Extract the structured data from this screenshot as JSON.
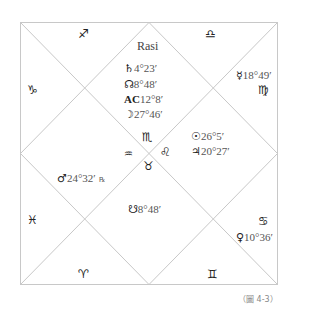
{
  "chart": {
    "title": "Rasi",
    "caption": "（圖 4-3）",
    "line_color": "#c8c8c8",
    "houses": {
      "top": {
        "sign": "♐"
      },
      "top_right": {
        "sign": "♎"
      },
      "right_upper": {
        "sign": "♍",
        "planets": [
          {
            "symbol": "☿",
            "degree": "18°49′"
          }
        ]
      },
      "right_lower": {
        "sign": "♋",
        "planets": [
          {
            "symbol": "♀",
            "degree": "10°36′"
          }
        ]
      },
      "bottom_right": {
        "sign": "♊"
      },
      "bottom_left": {
        "sign": "♈"
      },
      "left_lower": {
        "sign": "♓"
      },
      "left_upper": {
        "sign": "♑"
      },
      "center_top": {
        "sign": "♏",
        "planets": [
          {
            "symbol": "♄",
            "degree": "4°23′"
          },
          {
            "symbol": "☊",
            "degree": "8°48′"
          },
          {
            "symbol": "AC",
            "degree": "12°8′"
          },
          {
            "symbol": "☽",
            "degree": "27°46′"
          }
        ]
      },
      "center_right": {
        "sign": "♌",
        "planets": [
          {
            "symbol": "☉",
            "degree": "26°5′"
          },
          {
            "symbol": "♃",
            "degree": "20°27′"
          }
        ]
      },
      "center_left": {
        "sign": "♒",
        "planets": [
          {
            "symbol": "♂",
            "degree": "24°32′",
            "retrograde": "℞"
          }
        ]
      },
      "center_bottom": {
        "sign": "♉",
        "planets": [
          {
            "symbol": "☋",
            "degree": "8°48′"
          }
        ]
      }
    }
  }
}
